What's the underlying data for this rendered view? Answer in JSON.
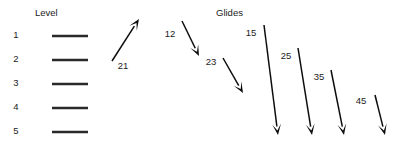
{
  "figure": {
    "width": 418,
    "height": 146,
    "background": "#ffffff",
    "ink_color": "#1b1b1b",
    "bar_color": "#2a2a2a",
    "arrow_color": "#0d0d0d"
  },
  "headers": {
    "level": "Level",
    "glides": "Glides"
  },
  "levels": [
    {
      "label": "1",
      "label_x": 16,
      "label_y": 38,
      "bar_x1": 52,
      "bar_x2": 88,
      "bar_y": 36
    },
    {
      "label": "2",
      "label_x": 16,
      "label_y": 62,
      "bar_x1": 52,
      "bar_x2": 88,
      "bar_y": 60
    },
    {
      "label": "3",
      "label_x": 16,
      "label_y": 86,
      "bar_x1": 52,
      "bar_x2": 88,
      "bar_y": 84
    },
    {
      "label": "4",
      "label_x": 16,
      "label_y": 110,
      "bar_x1": 52,
      "bar_x2": 88,
      "bar_y": 108
    },
    {
      "label": "5",
      "label_x": 16,
      "label_y": 134,
      "bar_x1": 52,
      "bar_x2": 88,
      "bar_y": 132
    }
  ],
  "glides": [
    {
      "label": "21",
      "from_level": 2,
      "to_level": 1,
      "direction": "up",
      "x1": 112,
      "y1": 61,
      "x2": 139,
      "y2": 19,
      "label_x": 123,
      "label_y": 69
    },
    {
      "label": "12",
      "from_level": 1,
      "to_level": 2,
      "direction": "down",
      "x1": 182,
      "y1": 21,
      "x2": 199,
      "y2": 56,
      "label_x": 170,
      "label_y": 37
    },
    {
      "label": "23",
      "from_level": 2,
      "to_level": 3,
      "direction": "down",
      "x1": 223,
      "y1": 58,
      "x2": 243,
      "y2": 93,
      "label_x": 211,
      "label_y": 65
    },
    {
      "label": "15",
      "from_level": 1,
      "to_level": 5,
      "direction": "down",
      "x1": 264,
      "y1": 25,
      "x2": 278,
      "y2": 135,
      "label_x": 251,
      "label_y": 36
    },
    {
      "label": "25",
      "from_level": 2,
      "to_level": 5,
      "direction": "down",
      "x1": 298,
      "y1": 48,
      "x2": 312,
      "y2": 135,
      "label_x": 286,
      "label_y": 59
    },
    {
      "label": "35",
      "from_level": 3,
      "to_level": 5,
      "direction": "down",
      "x1": 331,
      "y1": 70,
      "x2": 344,
      "y2": 135,
      "label_x": 319,
      "label_y": 80
    },
    {
      "label": "45",
      "from_level": 4,
      "to_level": 5,
      "direction": "down",
      "x1": 375,
      "y1": 95,
      "x2": 385,
      "y2": 135,
      "label_x": 361,
      "label_y": 104
    }
  ],
  "header_positions": {
    "level_x": 35,
    "level_y": 16,
    "glides_x": 216,
    "glides_y": 16
  }
}
